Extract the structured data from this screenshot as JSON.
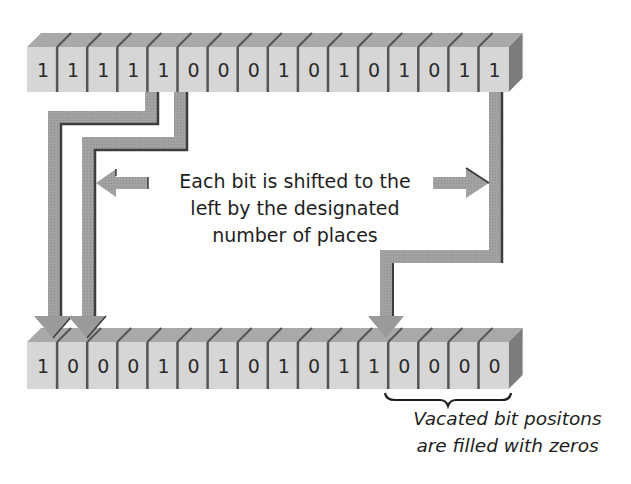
{
  "diagram": {
    "type": "bitwise-left-shift",
    "shift_amount": 4,
    "source_row": {
      "bits": [
        "1",
        "1",
        "1",
        "1",
        "1",
        "0",
        "0",
        "0",
        "1",
        "0",
        "1",
        "0",
        "1",
        "0",
        "1",
        "1"
      ]
    },
    "result_row": {
      "bits": [
        "1",
        "0",
        "0",
        "0",
        "1",
        "0",
        "1",
        "0",
        "1",
        "0",
        "1",
        "1",
        "0",
        "0",
        "0",
        "0"
      ]
    },
    "arrows": [
      {
        "from_index": 4,
        "to_index": 0
      },
      {
        "from_index": 5,
        "to_index": 1
      },
      {
        "from_index": 15,
        "to_index": 11
      }
    ],
    "vacated_range": [
      12,
      15
    ]
  },
  "captions": {
    "main": {
      "line1": "Each bit is shifted to the",
      "line2": "left by the designated",
      "line3": "number of places"
    },
    "vacated": {
      "line1": "Vacated bit positons",
      "line2": "are filled with zeros"
    }
  },
  "colors": {
    "cell_front": "#d6d6d6",
    "cell_top": "#a9a9a9",
    "cell_side": "#7c7c7c",
    "divider": "#555555",
    "arrow_fill": "#9a9a9a",
    "arrow_shadow": "#4a4a4a",
    "text": "#1e1e1e"
  }
}
